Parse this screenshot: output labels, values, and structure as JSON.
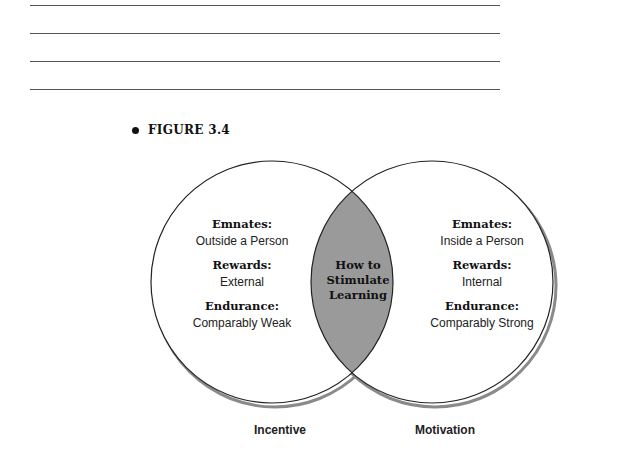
{
  "figure": {
    "label": "FIGURE 3.4",
    "left_circle": {
      "caption": "Incentive",
      "items": [
        {
          "heading": "Emnates:",
          "value": "Outside a Person"
        },
        {
          "heading": "Rewards:",
          "value": "External"
        },
        {
          "heading": "Endurance:",
          "value": "Comparably Weak"
        }
      ]
    },
    "right_circle": {
      "caption": "Motivation",
      "items": [
        {
          "heading": "Emnates:",
          "value": "Inside a Person"
        },
        {
          "heading": "Rewards:",
          "value": "Internal"
        },
        {
          "heading": "Endurance:",
          "value": "Comparably Strong"
        }
      ]
    },
    "intersection": {
      "lines": [
        "How to",
        "Stimulate",
        "Learning"
      ]
    }
  },
  "colors": {
    "intersection_fill": "#9a9a9a",
    "outline": "#222222",
    "shadow": "#8a8a8a"
  }
}
